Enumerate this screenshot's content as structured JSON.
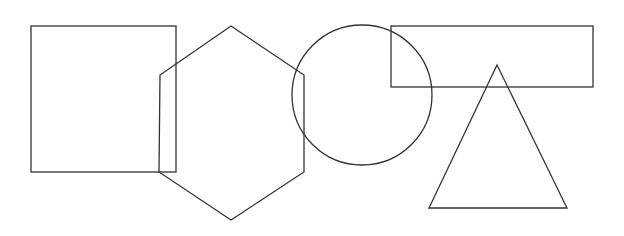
{
  "canvas": {
    "width": 624,
    "height": 236,
    "background": "#ffffff"
  },
  "style": {
    "stroke": "#333333",
    "stroke_width": 1.3
  },
  "shapes": [
    {
      "id": "square",
      "type": "rect",
      "x": 31,
      "y": 26,
      "width": 145,
      "height": 146
    },
    {
      "id": "hexagon",
      "type": "polygon",
      "points": "231,26 304,75 304,172 231,220 159,172 160,75"
    },
    {
      "id": "circle",
      "type": "circle",
      "cx": 362,
      "cy": 95,
      "r": 70
    },
    {
      "id": "rectangle",
      "type": "rect",
      "x": 391,
      "y": 26,
      "width": 202,
      "height": 61
    },
    {
      "id": "triangle",
      "type": "polygon",
      "points": "497,65 567,208 429,208"
    }
  ]
}
